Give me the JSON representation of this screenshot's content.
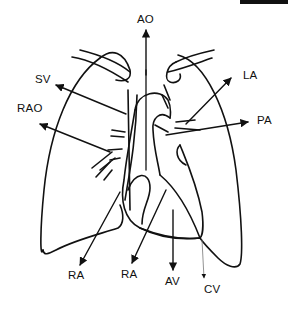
{
  "diagram": {
    "type": "chest radiograph outline (frontal view) with cardiac border labels",
    "labels": {
      "ao": "AO",
      "sv": "SV",
      "rao": "RAO",
      "la": "LA",
      "pa": "PA",
      "ra_left": "RA",
      "ra_right": "RA",
      "av": "AV",
      "cv": "CV"
    },
    "colors": {
      "line": "#111111",
      "background": "#ffffff"
    }
  }
}
